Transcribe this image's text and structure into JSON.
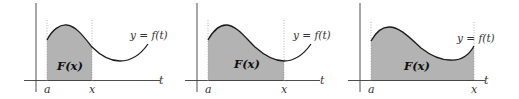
{
  "figure": {
    "colors": {
      "shade": "#b3b3b3",
      "curve": "#1a1a1a",
      "axis": "#3a3a3a",
      "guide": "#9a9a9a"
    },
    "panels": [
      {
        "id": "panel-1",
        "area_label": "F(x)",
        "curve_label": "y = f(t)",
        "axis_label": "t",
        "lower_limit_label": "a",
        "upper_limit_label": "x"
      },
      {
        "id": "panel-2",
        "area_label": "F(x)",
        "curve_label": "y = f(t)",
        "axis_label": "t",
        "lower_limit_label": "a",
        "upper_limit_label": "x"
      },
      {
        "id": "panel-3",
        "area_label": "F(x)",
        "curve_label": "y = f(t)",
        "axis_label": "t",
        "lower_limit_label": "a",
        "upper_limit_label": "x"
      }
    ]
  }
}
